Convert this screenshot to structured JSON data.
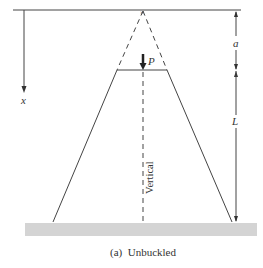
{
  "figure": {
    "caption": "(a)  Unbuckled",
    "labels": {
      "axis_x": "x",
      "load": "P",
      "dim_a": "a",
      "dim_L": "L",
      "centerline": "Vertical"
    },
    "colors": {
      "line": "#333333",
      "ground": "#d4d4d4",
      "background": "#ffffff"
    }
  }
}
